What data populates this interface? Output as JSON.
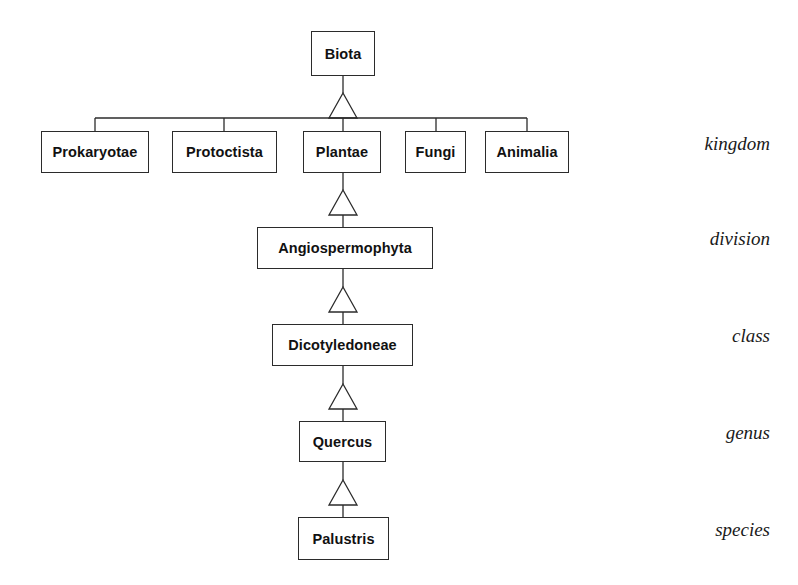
{
  "diagram": {
    "type": "uml-generalization-tree",
    "colors": {
      "background": "#ffffff",
      "line": "#2b2b2b",
      "box_fill": "#ffffff",
      "text": "#111111"
    },
    "root": {
      "label": "Biota",
      "x": 311,
      "y": 31,
      "w": 64,
      "h": 45
    },
    "kingdoms": [
      {
        "label": "Prokaryotae",
        "x": 41,
        "y": 131,
        "w": 108,
        "h": 42
      },
      {
        "label": "Protoctista",
        "x": 172,
        "y": 131,
        "w": 105,
        "h": 42
      },
      {
        "label": "Plantae",
        "x": 303,
        "y": 131,
        "w": 78,
        "h": 42
      },
      {
        "label": "Fungi",
        "x": 405,
        "y": 131,
        "w": 61,
        "h": 42
      },
      {
        "label": "Animalia",
        "x": 485,
        "y": 131,
        "w": 84,
        "h": 42
      }
    ],
    "lineage": [
      {
        "label": "Angiospermophyta",
        "x": 257,
        "y": 227,
        "w": 176,
        "h": 42
      },
      {
        "label": "Dicotyledoneae",
        "x": 272,
        "y": 324,
        "w": 141,
        "h": 42
      },
      {
        "label": "Quercus",
        "x": 299,
        "y": 421,
        "w": 87,
        "h": 41
      },
      {
        "label": "Palustris",
        "x": 298,
        "y": 517,
        "w": 91,
        "h": 43
      }
    ],
    "rank_labels": [
      {
        "text": "kingdom",
        "x": 600,
        "y": 133,
        "w": 170
      },
      {
        "text": "division",
        "x": 600,
        "y": 228,
        "w": 170
      },
      {
        "text": "class",
        "x": 600,
        "y": 325,
        "w": 170
      },
      {
        "text": "genus",
        "x": 600,
        "y": 422,
        "w": 170
      },
      {
        "text": "species",
        "x": 600,
        "y": 519,
        "w": 170
      }
    ]
  }
}
